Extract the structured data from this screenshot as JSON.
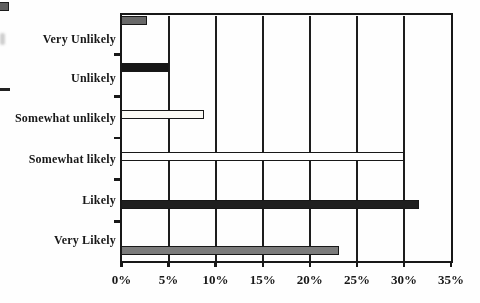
{
  "page": {
    "background": "#ffffff",
    "ink": "#181818"
  },
  "chart_data": {
    "type": "bar",
    "orientation": "horizontal",
    "title": "",
    "xlabel": "",
    "ylabel": "",
    "categories": [
      "Very Unlikely",
      "Unlikely",
      "Somewhat unlikely",
      "Somewhat likely",
      "Likely",
      "Very Likely"
    ],
    "values": [
      2.6,
      5,
      8.7,
      30,
      31.5,
      23
    ],
    "value_unit": "%",
    "xlim": [
      0,
      35
    ],
    "x_tick_step": 5,
    "x_tick_labels": [
      "0%",
      "5%",
      "10%",
      "15%",
      "20%",
      "25%",
      "30%",
      "35%"
    ],
    "grid": "vertical-gridlines-every-5pct",
    "legend_position": "none",
    "bar_styles": [
      {
        "fill": "#696969",
        "border": "#181818"
      },
      {
        "fill": "#161616",
        "border": "#181818"
      },
      {
        "fill": "#fbfaf5",
        "border": "#181818"
      },
      {
        "fill": "#fefefe",
        "border": "#181818"
      },
      {
        "fill": "#1f1f1f",
        "border": "#181818"
      },
      {
        "fill": "#7b7b7b",
        "border": "#181818"
      }
    ]
  },
  "scan_artifacts": {
    "top_left_bar_fragment_color": "#5e5e5e",
    "faint_text_fragment_color": "#c4c4c4",
    "middle_left_bar_fragment_color": "#222222"
  }
}
